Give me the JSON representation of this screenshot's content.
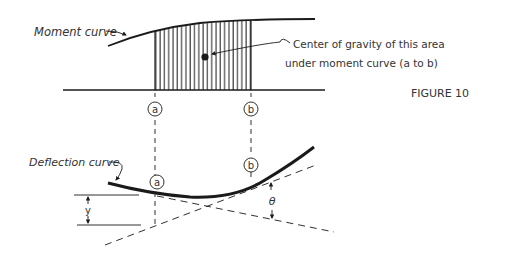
{
  "figure": {
    "title": "FIGURE 10",
    "moment_curve_label": "Moment curve",
    "cg_label_line1": "Center of gravity of this area",
    "cg_label_line2": "under moment curve (a to b)",
    "deflection_curve_label": "Deflection curve",
    "point_a": "a",
    "point_b": "b",
    "deflection_symbol": "y",
    "angle_symbol": "θ",
    "colors": {
      "ink": "#1a1a1a",
      "text": "#333333",
      "background": "#ffffff"
    }
  }
}
